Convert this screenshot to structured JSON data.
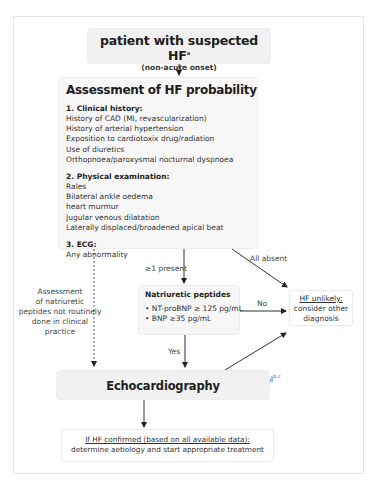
{
  "diagram": {
    "start": {
      "title": "patient with suspected HF",
      "title_sup": "a",
      "subtitle": "(non-acute onset)"
    },
    "assessment": {
      "title": "Assessment of HF probability",
      "sections": [
        {
          "heading": "1. Clinical history:",
          "items": [
            "History of CAD (MI, revascularization)",
            "History of arterial hypertension",
            "Exposition to cardiotoxix drug/radiation",
            "Use of diuretics",
            "Orthopnoea/paroxysmal nocturnal dyspnoea"
          ]
        },
        {
          "heading": "2. Physical examination:",
          "items": [
            "Rales",
            "Bilateral ankle oedema",
            "heart murmur",
            "Jugular venous dilatation",
            "Laterally displaced/broadened apical beat"
          ]
        },
        {
          "heading": "3. ECG:",
          "items": [
            "Any abnormality"
          ]
        }
      ]
    },
    "natriuretic": {
      "title": "Natriuretic peptides",
      "items": [
        "• NT-proBNP ≥ 125 pg/mL",
        "• BNP ≥35 pg/mL"
      ]
    },
    "unlikely": {
      "line1": "HF unlikely:",
      "line2": "consider other",
      "line3": "diagnosis"
    },
    "echo": {
      "title": "Echocardiography"
    },
    "confirmed": {
      "line1": "If HF confirmed (based on all available data):",
      "line2": "determine aetiology and start appropriate treatment"
    },
    "labels": {
      "present": "≥1 present",
      "all_absent": "All absent",
      "no": "No",
      "yes": "Yes",
      "normal": "Normal",
      "normal_sup": "b,c",
      "side_note": [
        "Assessment",
        "of natriuretic",
        "peptides not routinely",
        "done in clinical",
        "practice"
      ]
    },
    "colors": {
      "box_fill": "#f1f1f1",
      "border": "#e6e6e6",
      "arrow": "#2a2a2a",
      "text": "#2a2a2a"
    }
  }
}
